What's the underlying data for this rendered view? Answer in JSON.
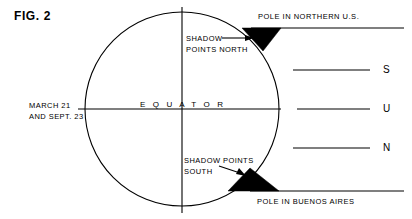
{
  "figure": {
    "title": "FIG. 2",
    "caption_date": {
      "line1": "MARCH 21",
      "line2": "AND SEPT. 23"
    },
    "equator_label": "E Q U A T O R",
    "annotations": {
      "shadow_north": {
        "line1": "SHADOW",
        "line2": "POINTS NORTH"
      },
      "shadow_south": {
        "line1": "SHADOW POINTS",
        "line2": "SOUTH"
      },
      "pole_north": "POLE IN NORTHERN U.S.",
      "pole_south": "POLE IN BUENOS AIRES"
    },
    "sun_rays": [
      {
        "letter": "S"
      },
      {
        "letter": "U"
      },
      {
        "letter": "N"
      }
    ],
    "colors": {
      "ink": "#000000",
      "background": "#ffffff",
      "shadow_fill": "#000000"
    }
  }
}
